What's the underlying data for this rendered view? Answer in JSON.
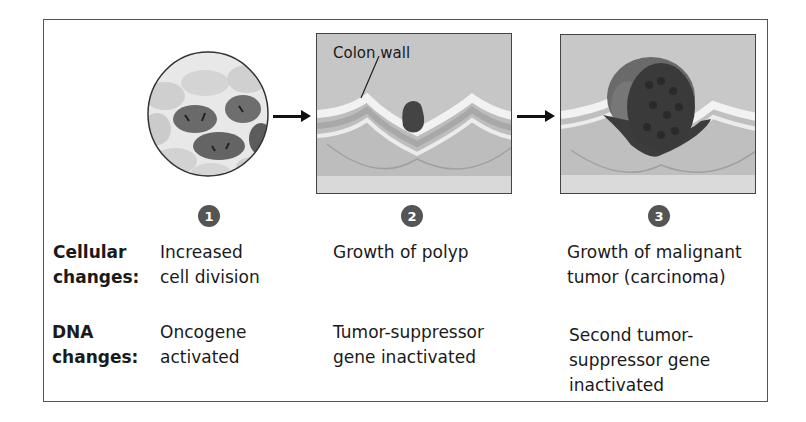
{
  "figure": {
    "stages": [
      {
        "number": "1",
        "image": "dividing-cells-circle",
        "cellular": [
          "Increased",
          "cell division"
        ],
        "dna": [
          "Oncogene",
          "activated"
        ]
      },
      {
        "number": "2",
        "image": "colon-wall-polyp",
        "callout": "Colon wall",
        "cellular": [
          "Growth of polyp"
        ],
        "dna": [
          "Tumor-suppressor",
          "gene inactivated"
        ]
      },
      {
        "number": "3",
        "image": "malignant-tumor",
        "cellular": [
          "Growth of malignant",
          "tumor (carcinoma)"
        ],
        "dna": [
          "Second tumor-",
          "suppressor gene",
          "inactivated"
        ]
      }
    ],
    "row_labels": {
      "cellular": [
        "Cellular",
        "changes:"
      ],
      "dna": [
        "DNA",
        "changes:"
      ]
    },
    "colors": {
      "badge": "#555555",
      "border": "#555555",
      "tumor": "#3a3a3a"
    }
  }
}
